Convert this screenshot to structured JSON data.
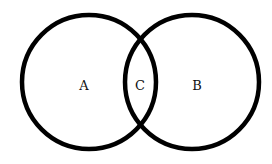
{
  "diagram": {
    "type": "venn",
    "stroke_color": "#000000",
    "background": "#ffffff",
    "sets": [
      {
        "id": "A",
        "label": "A",
        "cx": 89,
        "cy": 82,
        "r": 68
      },
      {
        "id": "B",
        "label": "B",
        "cx": 192,
        "cy": 82,
        "r": 68
      }
    ],
    "intersection": {
      "label": "C"
    }
  }
}
